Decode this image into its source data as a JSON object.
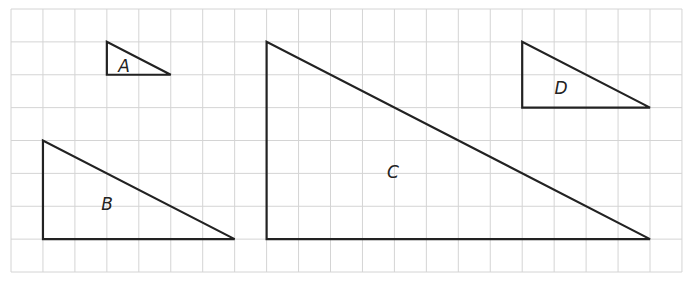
{
  "grid": {
    "origin_x": 11,
    "origin_y": 9,
    "cols": 21,
    "rows": 8,
    "cell_w": 31.95,
    "cell_h": 32.875,
    "line_color": "#d4d4d4"
  },
  "triangles": [
    {
      "label": "A",
      "right_angle_col": 3,
      "top_row": 1,
      "base_row": 2,
      "right_col": 5,
      "label_pos": [
        124,
        72
      ]
    },
    {
      "label": "B",
      "right_angle_col": 1,
      "top_row": 4,
      "base_row": 7,
      "right_col": 7,
      "label_pos": [
        107,
        210
      ]
    },
    {
      "label": "C",
      "right_angle_col": 8,
      "top_row": 1,
      "base_row": 7,
      "right_col": 20,
      "label_pos": [
        393,
        178
      ]
    },
    {
      "label": "D",
      "right_angle_col": 16,
      "top_row": 1,
      "base_row": 3,
      "right_col": 20,
      "label_pos": [
        561,
        94
      ]
    }
  ],
  "stroke_color": "#222222"
}
